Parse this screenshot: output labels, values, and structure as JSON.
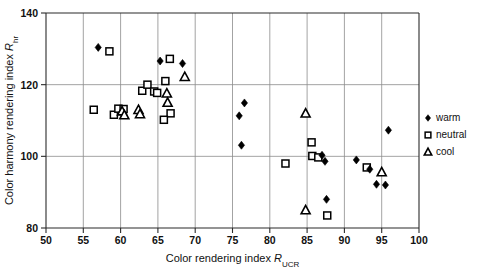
{
  "chart_data": {
    "type": "scatter",
    "title": "",
    "xlabel": "Color rendering index R_UCR",
    "xlabel_main": "Color rendering index ",
    "xlabel_italic": "R",
    "xlabel_sub": "UCR",
    "ylabel": "Color harmony rendering index R_hr",
    "ylabel_main": "Color harmony rendering index ",
    "ylabel_italic": "R",
    "ylabel_sub": "hr",
    "xlim": [
      50,
      100
    ],
    "ylim": [
      80,
      140
    ],
    "xticks": [
      50,
      55,
      60,
      65,
      70,
      75,
      80,
      85,
      90,
      95,
      100
    ],
    "yticks": [
      80,
      100,
      120,
      140
    ],
    "xtick_labels": [
      "50",
      "55",
      "60",
      "65",
      "70",
      "75",
      "80",
      "85",
      "90",
      "95",
      "100"
    ],
    "ytick_labels": [
      "80",
      "100",
      "120",
      "140"
    ],
    "grid": true,
    "grid_x_values": [
      55,
      60,
      65,
      70,
      75,
      80,
      85,
      90,
      95
    ],
    "grid_y_values": [
      100,
      120
    ],
    "legend_position": "right-outside",
    "series": [
      {
        "name": "warm",
        "marker": "filled-diamond",
        "color": "#000000",
        "points": [
          [
            57.0,
            130.4
          ],
          [
            65.3,
            126.6
          ],
          [
            68.3,
            125.9
          ],
          [
            75.9,
            111.3
          ],
          [
            76.2,
            103.1
          ],
          [
            76.6,
            114.9
          ],
          [
            87.0,
            100.3
          ],
          [
            87.4,
            98.6
          ],
          [
            87.6,
            88.0
          ],
          [
            91.6,
            99.0
          ],
          [
            93.4,
            96.4
          ],
          [
            94.3,
            92.2
          ],
          [
            95.5,
            92.0
          ],
          [
            95.9,
            107.3
          ]
        ]
      },
      {
        "name": "neutral",
        "marker": "open-square",
        "color": "#000000",
        "points": [
          [
            56.4,
            113.0
          ],
          [
            58.5,
            129.3
          ],
          [
            59.1,
            111.6
          ],
          [
            59.7,
            113.3
          ],
          [
            60.4,
            113.2
          ],
          [
            62.9,
            118.3
          ],
          [
            63.6,
            120.0
          ],
          [
            64.5,
            118.1
          ],
          [
            64.9,
            117.7
          ],
          [
            66.0,
            121.0
          ],
          [
            66.6,
            127.2
          ],
          [
            66.7,
            112.0
          ],
          [
            65.8,
            110.2
          ],
          [
            82.1,
            98.0
          ],
          [
            85.6,
            103.9
          ],
          [
            85.7,
            100.1
          ],
          [
            86.5,
            99.7
          ],
          [
            87.7,
            83.5
          ],
          [
            93.0,
            96.9
          ]
        ]
      },
      {
        "name": "cool",
        "marker": "open-triangle",
        "color": "#000000",
        "points": [
          [
            60.2,
            112.6
          ],
          [
            60.5,
            111.5
          ],
          [
            62.4,
            113.0
          ],
          [
            62.6,
            111.8
          ],
          [
            66.2,
            117.6
          ],
          [
            66.3,
            115.0
          ],
          [
            68.6,
            122.2
          ],
          [
            84.8,
            112.0
          ],
          [
            84.8,
            85.0
          ],
          [
            95.0,
            95.6
          ]
        ]
      }
    ]
  },
  "legend": {
    "items": [
      {
        "label": "warm",
        "marker": "filled-diamond"
      },
      {
        "label": "neutral",
        "marker": "open-square"
      },
      {
        "label": "cool",
        "marker": "open-triangle"
      }
    ]
  }
}
